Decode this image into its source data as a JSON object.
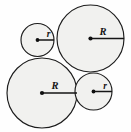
{
  "diagram": {
    "background_color": "#fefefe",
    "fill_color": "#f1f1ef",
    "stroke_color": "#1c1c1c",
    "label_color": "#141414",
    "circles": [
      {
        "id": "top-left-small",
        "label": "r",
        "size": "small",
        "cx": 37.5,
        "cy": 40.0,
        "radius": 16.5,
        "label_x": 48.5,
        "label_y": 37.0,
        "radius_line_end_x": 54.0,
        "radius_line_end_y": 40.0
      },
      {
        "id": "top-right-large",
        "label": "R",
        "size": "large",
        "cx": 90.5,
        "cy": 38.5,
        "radius": 33.5,
        "label_x": 103.0,
        "label_y": 34.5,
        "radius_line_end_x": 124.0,
        "radius_line_end_y": 38.5
      },
      {
        "id": "bottom-left-large",
        "label": "R",
        "size": "large",
        "cx": 42.0,
        "cy": 93.0,
        "radius": 35.0,
        "label_x": 55.0,
        "label_y": 89.0,
        "radius_line_end_x": 77.0,
        "radius_line_end_y": 93.0
      },
      {
        "id": "bottom-right-small",
        "label": "r",
        "size": "small",
        "cx": 93.5,
        "cy": 91.5,
        "radius": 18.5,
        "label_x": 105.0,
        "label_y": 88.5,
        "radius_line_end_x": 112.0,
        "radius_line_end_y": 91.5
      }
    ]
  }
}
